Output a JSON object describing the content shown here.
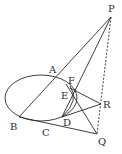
{
  "diagram": {
    "type": "geometry",
    "points": {
      "P": {
        "label": "P",
        "x": 111,
        "y": 17
      },
      "A": {
        "label": "A",
        "x": 56,
        "y": 77
      },
      "B": {
        "label": "B",
        "x": 19,
        "y": 117
      },
      "C": {
        "label": "C",
        "x": 47,
        "y": 124
      },
      "D": {
        "label": "D",
        "x": 63,
        "y": 117
      },
      "E": {
        "label": "E",
        "x": 67,
        "y": 97
      },
      "F": {
        "label": "F",
        "x": 72,
        "y": 87
      },
      "Q": {
        "label": "Q",
        "x": 97,
        "y": 134
      },
      "R": {
        "label": "R",
        "x": 101,
        "y": 104
      }
    },
    "labels": [
      "P",
      "A",
      "F",
      "E",
      "R",
      "B",
      "C",
      "D",
      "Q"
    ],
    "segments": [
      {
        "from": "P",
        "to": "B",
        "style": "solid"
      },
      {
        "from": "P",
        "to": "D",
        "style": "solid"
      },
      {
        "from": "P",
        "to": "Q",
        "style": "dashed"
      },
      {
        "from": "B",
        "to": "Q",
        "style": "solid"
      },
      {
        "from": "F",
        "to": "R",
        "style": "solid"
      },
      {
        "from": "D",
        "to": "R",
        "style": "solid"
      },
      {
        "from": "F",
        "to": "Q",
        "style": "solid"
      }
    ],
    "curves": [
      {
        "name": "ellipse",
        "cx": 44,
        "cy": 98,
        "rx": 38,
        "ry": 25
      },
      {
        "name": "inner-arc",
        "through": [
          "F",
          "E",
          "D"
        ]
      }
    ]
  }
}
